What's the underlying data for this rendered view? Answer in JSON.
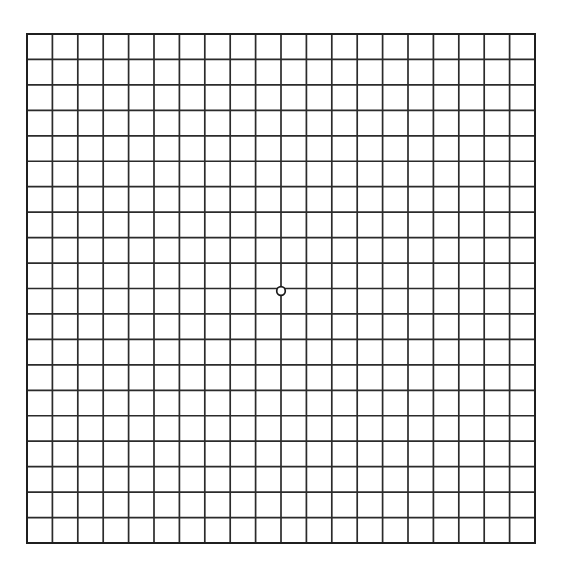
{
  "page": {
    "background_color": "#ffffff",
    "width": 562,
    "height": 568
  },
  "grid": {
    "name": "amsler-grid",
    "description": "Amsler grid eye test chart",
    "columns": 20,
    "rows": 20,
    "origin_x": 27,
    "origin_y": 34,
    "cell_width": 25.4,
    "cell_height": 25.45,
    "total_width": 508,
    "total_height": 509,
    "line_color": "#2b2b2b",
    "line_width": 1.7,
    "border_color": "#1f1f1f",
    "border_width": 2.0,
    "cell_fill": "#ffffff"
  },
  "fixation_point": {
    "name": "center-fixation-dot",
    "shape": "circle",
    "center_x": 281,
    "center_y": 291,
    "radius": 4.3,
    "stroke_color": "#1a1a1a",
    "stroke_width": 1.7,
    "fill_color": "#ffffff"
  },
  "chart_data": {
    "type": "table",
    "columns": 20,
    "rows": 20,
    "xlabel": "",
    "ylabel": "",
    "grid": true,
    "legend": "none",
    "annotations": [
      {
        "label": "central fixation dot",
        "x": 10,
        "y": 10
      }
    ]
  }
}
